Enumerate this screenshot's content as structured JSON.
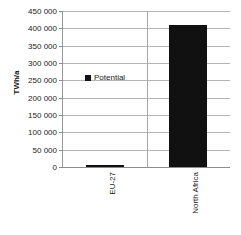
{
  "chart_data": {
    "type": "bar",
    "title": "",
    "xlabel": "",
    "ylabel": "TWh/a",
    "categories": [
      "EU-27",
      "North Africa"
    ],
    "values": [
      5000,
      410000
    ],
    "series": [
      {
        "name": "Potential",
        "values": [
          5000,
          410000
        ]
      }
    ],
    "legend": [
      "Potential"
    ],
    "legend_position": "inside-upper-left",
    "ylim": [
      0,
      450000
    ],
    "ytick_values": [
      0,
      50000,
      100000,
      150000,
      200000,
      250000,
      300000,
      350000,
      400000,
      450000
    ],
    "ytick_labels": [
      "0",
      "50 000",
      "100 000",
      "150 000",
      "200 000",
      "250 000",
      "300 000",
      "350 000",
      "400 000",
      "450 000"
    ],
    "grid": true,
    "bar_color": "#111111",
    "gridline_color": "#b4b4b4",
    "axis_color": "#8c8c8c",
    "background": "#ffffff"
  }
}
